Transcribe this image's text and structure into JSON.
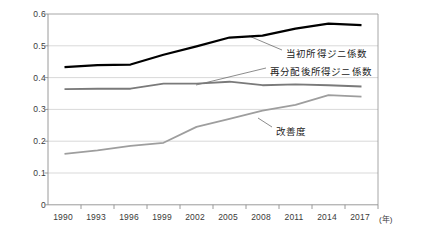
{
  "chart_data": {
    "type": "line",
    "title": "",
    "xlabel": "年",
    "ylabel": "",
    "categories": [
      "1990",
      "1993",
      "1996",
      "1999",
      "2002",
      "2005",
      "2008",
      "2011",
      "2014",
      "2017"
    ],
    "ylim": [
      0,
      0.6
    ],
    "ytick_labels": [
      "0",
      "0.1",
      "0.2",
      "0.3",
      "0.4",
      "0.5",
      "0.6"
    ],
    "ytick_values": [
      0,
      0.1,
      0.2,
      0.3,
      0.4,
      0.5,
      0.6
    ],
    "grid": true,
    "legend_position": "inline-annotations",
    "series": [
      {
        "name": "当初所得ジニ係数",
        "color": "#000000",
        "values": [
          0.433,
          0.439,
          0.441,
          0.472,
          0.498,
          0.526,
          0.532,
          0.554,
          0.57,
          0.565
        ]
      },
      {
        "name": "再分配後所得ジニ係数",
        "color": "#7a7a7a",
        "values": [
          0.364,
          0.365,
          0.365,
          0.381,
          0.381,
          0.387,
          0.376,
          0.379,
          0.376,
          0.372
        ]
      },
      {
        "name": "改善度",
        "color": "#9e9e9e",
        "values": [
          0.16,
          0.171,
          0.185,
          0.195,
          0.245,
          0.27,
          0.296,
          0.314,
          0.345,
          0.34
        ]
      }
    ]
  },
  "axis": {
    "x_unit_label": "(年)"
  },
  "annotations": [
    {
      "text": "当初所得ジニ係数",
      "x": 286,
      "y": 53
    },
    {
      "text": "再分配後所得ジニ係数",
      "x": 270,
      "y": 71
    },
    {
      "text": "改善度",
      "x": 276,
      "y": 131
    }
  ]
}
